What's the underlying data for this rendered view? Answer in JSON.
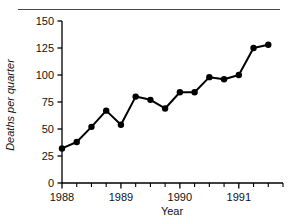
{
  "figure": {
    "has_top_rule": true,
    "background_color": "#ffffff",
    "line_color": "#000000",
    "marker_color": "#000000",
    "axis_color": "#000000"
  },
  "chart_data": {
    "type": "line",
    "title": "",
    "xlabel": "Year",
    "ylabel": "Deaths per quarter",
    "xlim": [
      1988.0,
      1991.75
    ],
    "ylim": [
      0,
      150
    ],
    "grid": false,
    "legend": null,
    "y_ticks": [
      0,
      25,
      50,
      75,
      100,
      125,
      150
    ],
    "y_tick_labels": [
      "0",
      "25",
      "50",
      "75",
      "100",
      "125",
      "150"
    ],
    "x_ticks": [
      1988,
      1989,
      1990,
      1991
    ],
    "x_tick_labels": [
      "1988",
      "1989",
      "1990",
      "1991"
    ],
    "x_minor_ticks": [
      1988.25,
      1988.5,
      1988.75,
      1989.25,
      1989.5,
      1989.75,
      1990.25,
      1990.5,
      1990.75,
      1991.25,
      1991.5,
      1991.75
    ],
    "x": [
      1988.0,
      1988.25,
      1988.5,
      1988.75,
      1989.0,
      1989.25,
      1989.5,
      1989.75,
      1990.0,
      1990.25,
      1990.5,
      1990.75,
      1991.0,
      1991.25,
      1991.5
    ],
    "x_point_labels": [
      "1988 Q1",
      "1988 Q2",
      "1988 Q3",
      "1988 Q4",
      "1989 Q1",
      "1989 Q2",
      "1989 Q3",
      "1989 Q4",
      "1990 Q1",
      "1990 Q2",
      "1990 Q3",
      "1990 Q4",
      "1991 Q1",
      "1991 Q2",
      "1991 Q3"
    ],
    "values": [
      32,
      38,
      52,
      67,
      54,
      80,
      77,
      69,
      84,
      84,
      98,
      96,
      100,
      125,
      128
    ],
    "marker": "circle",
    "marker_size": 3.2,
    "line_width": 2
  }
}
